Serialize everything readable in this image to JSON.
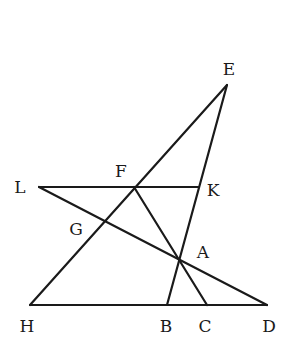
{
  "diagram": {
    "type": "geometry",
    "points": {
      "E": {
        "label": "E",
        "x": 227,
        "y": 85,
        "lx": 229,
        "ly": 75
      },
      "L": {
        "label": "L",
        "x": 39,
        "y": 187,
        "lx": 20,
        "ly": 193
      },
      "F": {
        "label": "F",
        "x": 134,
        "y": 187,
        "lx": 121,
        "ly": 177
      },
      "K": {
        "label": "K",
        "x": 199,
        "y": 187,
        "lx": 213,
        "ly": 196
      },
      "G": {
        "label": "G",
        "x": 104,
        "y": 222,
        "lx": 76,
        "ly": 235
      },
      "A": {
        "label": "A",
        "x": 179,
        "y": 261,
        "lx": 203,
        "ly": 258
      },
      "H": {
        "label": "H",
        "x": 30,
        "y": 305,
        "lx": 27,
        "ly": 332
      },
      "B": {
        "label": "B",
        "x": 167,
        "y": 305,
        "lx": 166,
        "ly": 332
      },
      "C": {
        "label": "C",
        "x": 207,
        "y": 305,
        "lx": 205,
        "ly": 332
      },
      "D": {
        "label": "D",
        "x": 267,
        "y": 305,
        "lx": 269,
        "ly": 332
      }
    },
    "segments": [
      {
        "name": "line-HE",
        "from": "H",
        "to": "E"
      },
      {
        "name": "line-EB",
        "from": "E",
        "to": "B"
      },
      {
        "name": "line-LK",
        "from": "L",
        "to": "K"
      },
      {
        "name": "line-LD",
        "from": "L",
        "to": "D"
      },
      {
        "name": "line-FC",
        "from": "F",
        "to": "C"
      },
      {
        "name": "line-HD",
        "from": "H",
        "to": "D"
      }
    ],
    "labels": [
      "E",
      "F",
      "L",
      "K",
      "G",
      "A",
      "H",
      "B",
      "C",
      "D"
    ]
  }
}
